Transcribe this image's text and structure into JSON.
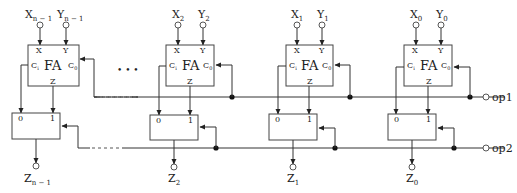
{
  "diagram": {
    "title": "",
    "ellipsis": "• • •",
    "stages": [
      {
        "id": "n-1",
        "x_label": "X",
        "x_sub": "n − 1",
        "y_label": "Y",
        "y_sub": "n − 1",
        "fa_label": "FA",
        "fa_x": "X",
        "fa_y": "Y",
        "fa_ci": "C",
        "fa_ci_sub": "i",
        "fa_co": "C",
        "fa_co_sub": "0",
        "fa_z": "Z",
        "mux_in0": "0",
        "mux_in1": "1",
        "z_label": "Z",
        "z_sub": "n − 1"
      },
      {
        "id": "2",
        "x_label": "X",
        "x_sub": "2",
        "y_label": "Y",
        "y_sub": "2",
        "fa_label": "FA",
        "fa_x": "X",
        "fa_y": "Y",
        "fa_ci": "C",
        "fa_ci_sub": "i",
        "fa_co": "C",
        "fa_co_sub": "0",
        "fa_z": "Z",
        "mux_in0": "0",
        "mux_in1": "1",
        "z_label": "Z",
        "z_sub": "2"
      },
      {
        "id": "1",
        "x_label": "X",
        "x_sub": "1",
        "y_label": "Y",
        "y_sub": "1",
        "fa_label": "FA",
        "fa_x": "X",
        "fa_y": "Y",
        "fa_ci": "C",
        "fa_ci_sub": "i",
        "fa_co": "C",
        "fa_co_sub": "0",
        "fa_z": "Z",
        "mux_in0": "0",
        "mux_in1": "1",
        "z_label": "Z",
        "z_sub": "1"
      },
      {
        "id": "0",
        "x_label": "X",
        "x_sub": "0",
        "y_label": "Y",
        "y_sub": "0",
        "fa_label": "FA",
        "fa_x": "X",
        "fa_y": "Y",
        "fa_ci": "C",
        "fa_ci_sub": "i",
        "fa_co": "C",
        "fa_co_sub": "0",
        "fa_z": "Z",
        "mux_in0": "0",
        "mux_in1": "1",
        "z_label": "Z",
        "z_sub": "0"
      }
    ],
    "control_lines": [
      {
        "label": "op1"
      },
      {
        "label": "op2"
      }
    ],
    "colors": {
      "line": "#333333",
      "background": "#ffffff"
    }
  }
}
